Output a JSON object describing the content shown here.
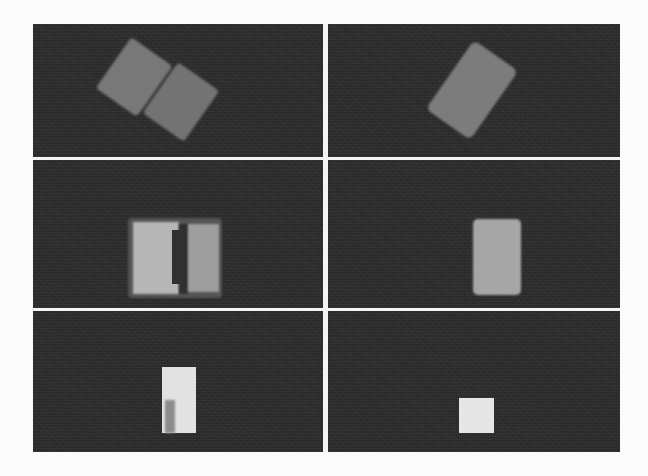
{
  "figure": {
    "layout": {
      "rows": 3,
      "cols": 2
    },
    "colors": {
      "background": "#2d2d2d",
      "divider": "#f4f4f4",
      "page": "#fbfbfb"
    },
    "panels": [
      {
        "id": "r1c1",
        "description": "two rotated gray blocks separated by dark gap",
        "shapes": [
          {
            "kind": "block-left",
            "color": "#787878",
            "rotation_deg": 35
          },
          {
            "kind": "block-right",
            "color": "#737373",
            "rotation_deg": 35
          },
          {
            "kind": "gap",
            "color": "#3c3c3c",
            "rotation_deg": 35
          }
        ]
      },
      {
        "id": "r1c2",
        "description": "single rotated gray block",
        "shapes": [
          {
            "kind": "block",
            "color": "#7c7c7c",
            "rotation_deg": 35
          }
        ]
      },
      {
        "id": "r2c1",
        "description": "two upright blocks with notch and dark gap",
        "shapes": [
          {
            "kind": "halo",
            "color": "#555555"
          },
          {
            "kind": "block-left",
            "color": "#b6b6b6"
          },
          {
            "kind": "block-right",
            "color": "#9e9e9e"
          },
          {
            "kind": "gap",
            "color": "#303030"
          }
        ]
      },
      {
        "id": "r2c2",
        "description": "single upright gray block",
        "shapes": [
          {
            "kind": "block",
            "color": "#a6a6a6"
          }
        ]
      },
      {
        "id": "r3c1",
        "description": "tall light block with darker lower-left section",
        "shapes": [
          {
            "kind": "block",
            "color": "#e2e2e2"
          },
          {
            "kind": "shade",
            "color": "#8c8c8c"
          }
        ]
      },
      {
        "id": "r3c2",
        "description": "small light square",
        "shapes": [
          {
            "kind": "block",
            "color": "#e6e6e6"
          }
        ]
      }
    ]
  }
}
